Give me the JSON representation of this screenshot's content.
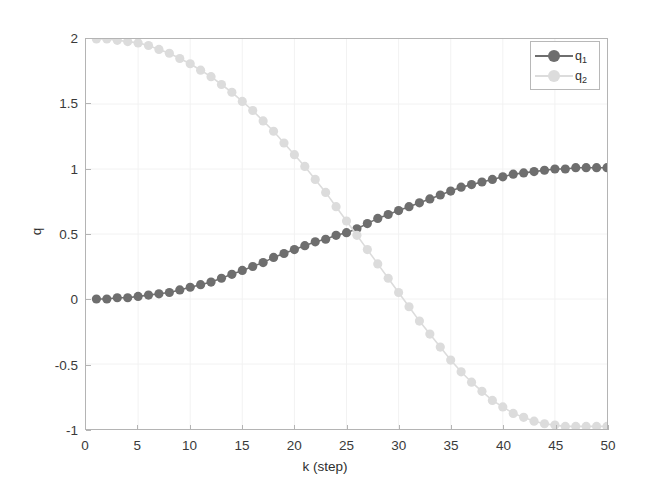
{
  "chart_data": {
    "type": "line",
    "title": "",
    "xlabel": "k (step)",
    "ylabel": "q",
    "xlim": [
      0,
      50
    ],
    "ylim": [
      -1,
      2
    ],
    "xticks": [
      0,
      5,
      10,
      15,
      20,
      25,
      30,
      35,
      40,
      45,
      50
    ],
    "xtick_labels": [
      "0",
      "5",
      "10",
      "15",
      "20",
      "25",
      "30",
      "35",
      "40",
      "45",
      "50"
    ],
    "yticks": [
      -1,
      -0.5,
      0,
      0.5,
      1,
      1.5,
      2
    ],
    "ytick_labels": [
      "-1",
      "-0.5",
      "0",
      "0.5",
      "1",
      "1.5",
      "2"
    ],
    "grid": true,
    "legend_position": "upper right",
    "marker": "circle",
    "x": [
      1,
      2,
      3,
      4,
      5,
      6,
      7,
      8,
      9,
      10,
      11,
      12,
      13,
      14,
      15,
      16,
      17,
      18,
      19,
      20,
      21,
      22,
      23,
      24,
      25,
      26,
      27,
      28,
      29,
      30,
      31,
      32,
      33,
      34,
      35,
      36,
      37,
      38,
      39,
      40,
      41,
      42,
      43,
      44,
      45,
      46,
      47,
      48,
      49,
      50
    ],
    "series": [
      {
        "name": "q_1",
        "label": "q₁",
        "color": "#6e6e6e",
        "values": [
          0.0,
          0.0,
          0.01,
          0.01,
          0.02,
          0.03,
          0.04,
          0.05,
          0.07,
          0.09,
          0.11,
          0.13,
          0.16,
          0.19,
          0.22,
          0.25,
          0.28,
          0.32,
          0.35,
          0.38,
          0.41,
          0.44,
          0.46,
          0.49,
          0.51,
          0.54,
          0.58,
          0.62,
          0.65,
          0.68,
          0.71,
          0.74,
          0.77,
          0.8,
          0.83,
          0.86,
          0.88,
          0.9,
          0.92,
          0.94,
          0.96,
          0.97,
          0.98,
          0.99,
          1.0,
          1.0,
          1.01,
          1.01,
          1.01,
          1.01
        ]
      },
      {
        "name": "q_2",
        "label": "q₂",
        "color": "#dcdcdc",
        "values": [
          2.0,
          2.0,
          1.99,
          1.98,
          1.97,
          1.95,
          1.92,
          1.89,
          1.85,
          1.81,
          1.76,
          1.71,
          1.65,
          1.59,
          1.52,
          1.45,
          1.37,
          1.29,
          1.2,
          1.11,
          1.02,
          0.92,
          0.82,
          0.71,
          0.6,
          0.49,
          0.38,
          0.27,
          0.16,
          0.05,
          -0.06,
          -0.17,
          -0.27,
          -0.37,
          -0.47,
          -0.56,
          -0.64,
          -0.71,
          -0.78,
          -0.83,
          -0.88,
          -0.91,
          -0.94,
          -0.96,
          -0.97,
          -0.98,
          -0.98,
          -0.98,
          -0.98,
          -0.98
        ]
      }
    ]
  },
  "axis": {
    "ylabel": "q",
    "xlabel": "k (step)"
  },
  "legend": {
    "entries": [
      {
        "label": "q",
        "sub": "1"
      },
      {
        "label": "q",
        "sub": "2"
      }
    ]
  }
}
